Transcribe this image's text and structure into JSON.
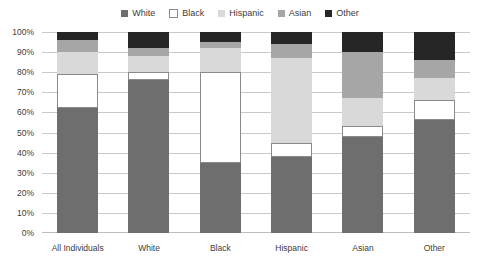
{
  "legend": {
    "position": "top-center",
    "items": [
      {
        "label": "White",
        "color": "#6e6e6e",
        "swatch": "filled"
      },
      {
        "label": "Black",
        "color": "#ffffff",
        "swatch": "outlined"
      },
      {
        "label": "Hispanic",
        "color": "#d9d9d9",
        "swatch": "filled"
      },
      {
        "label": "Asian",
        "color": "#a6a6a6",
        "swatch": "filled"
      },
      {
        "label": "Other",
        "color": "#262626",
        "swatch": "filled"
      }
    ]
  },
  "axis": {
    "y_ticks": [
      "0%",
      "10%",
      "20%",
      "30%",
      "40%",
      "50%",
      "60%",
      "70%",
      "80%",
      "90%",
      "100%"
    ],
    "x_categories": [
      "All Individuals",
      "White",
      "Black",
      "Hispanic",
      "Asian",
      "Other"
    ]
  },
  "chart_data": {
    "type": "bar",
    "title": "",
    "subtitle": "",
    "xlabel": "",
    "ylabel": "",
    "stacked": true,
    "stack_mode": "percent",
    "grid": true,
    "legend_position": "top-center",
    "ylim": [
      0,
      100
    ],
    "ytick_labels": [
      "0%",
      "10%",
      "20%",
      "30%",
      "40%",
      "50%",
      "60%",
      "70%",
      "80%",
      "90%",
      "100%"
    ],
    "categories": [
      "All Individuals",
      "White",
      "Black",
      "Hispanic",
      "Asian",
      "Other"
    ],
    "series": [
      {
        "name": "White",
        "color": "#6e6e6e",
        "values": [
          62,
          76,
          35,
          38,
          48,
          56
        ]
      },
      {
        "name": "Black",
        "color": "#ffffff",
        "values": [
          17,
          4,
          45,
          7,
          5,
          10
        ]
      },
      {
        "name": "Hispanic",
        "color": "#d9d9d9",
        "values": [
          11,
          8,
          12,
          42,
          14,
          11
        ]
      },
      {
        "name": "Asian",
        "color": "#a6a6a6",
        "values": [
          6,
          4,
          3,
          7,
          23,
          9
        ]
      },
      {
        "name": "Other",
        "color": "#262626",
        "values": [
          4,
          8,
          5,
          6,
          10,
          14
        ]
      }
    ]
  }
}
